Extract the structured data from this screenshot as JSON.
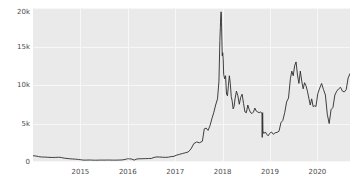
{
  "chart_data": {
    "type": "line",
    "title": "",
    "subtitle": "",
    "xlabel": "",
    "ylabel": "",
    "xlim": [
      2014.0,
      2020.7
    ],
    "ylim": [
      0,
      20000
    ],
    "grid": true,
    "legend": "none",
    "y_ticks": [
      {
        "value": 0,
        "label": "0"
      },
      {
        "value": 5000,
        "label": "5k"
      },
      {
        "value": 10000,
        "label": "10k"
      },
      {
        "value": 15000,
        "label": "15k"
      },
      {
        "value": 20000,
        "label": "20k"
      }
    ],
    "x_ticks": [
      {
        "value": 2015,
        "label": "2015"
      },
      {
        "value": 2016,
        "label": "2016"
      },
      {
        "value": 2017,
        "label": "2017"
      },
      {
        "value": 2018,
        "label": "2018"
      },
      {
        "value": 2019,
        "label": "2019"
      },
      {
        "value": 2020,
        "label": "2020"
      }
    ],
    "line_color": "#2b2b2b",
    "panel_color": "#eaeaea",
    "grid_color": "#f7f7f7",
    "series": [
      {
        "name": "price",
        "x": [
          2014.0,
          2014.06,
          2014.12,
          2014.18,
          2014.24,
          2014.3,
          2014.36,
          2014.42,
          2014.48,
          2014.54,
          2014.6,
          2014.66,
          2014.72,
          2014.78,
          2014.84,
          2014.9,
          2014.96,
          2015.02,
          2015.08,
          2015.14,
          2015.2,
          2015.26,
          2015.32,
          2015.38,
          2015.44,
          2015.5,
          2015.56,
          2015.62,
          2015.68,
          2015.74,
          2015.8,
          2015.86,
          2015.92,
          2015.98,
          2016.0,
          2016.02,
          2016.04,
          2016.08,
          2016.14,
          2016.2,
          2016.26,
          2016.32,
          2016.38,
          2016.44,
          2016.5,
          2016.56,
          2016.62,
          2016.68,
          2016.74,
          2016.8,
          2016.86,
          2016.92,
          2016.98,
          2017.04,
          2017.1,
          2017.16,
          2017.22,
          2017.28,
          2017.34,
          2017.4,
          2017.46,
          2017.52,
          2017.58,
          2017.62,
          2017.66,
          2017.7,
          2017.74,
          2017.78,
          2017.82,
          2017.86,
          2017.9,
          2017.93,
          2017.95,
          2017.96,
          2017.97,
          2017.975,
          2017.98,
          2017.985,
          2017.99,
          2018.0,
          2018.01,
          2018.02,
          2018.03,
          2018.05,
          2018.07,
          2018.09,
          2018.11,
          2018.13,
          2018.15,
          2018.17,
          2018.19,
          2018.21,
          2018.23,
          2018.25,
          2018.27,
          2018.3,
          2018.33,
          2018.36,
          2018.39,
          2018.42,
          2018.45,
          2018.48,
          2018.51,
          2018.54,
          2018.57,
          2018.6,
          2018.63,
          2018.66,
          2018.69,
          2018.72,
          2018.75,
          2018.78,
          2018.8,
          2018.82,
          2018.83,
          2018.84,
          2018.845,
          2018.85,
          2018.855,
          2018.86,
          2018.88,
          2018.91,
          2018.94,
          2018.97,
          2019.0,
          2019.04,
          2019.08,
          2019.12,
          2019.16,
          2019.2,
          2019.24,
          2019.28,
          2019.32,
          2019.36,
          2019.4,
          2019.44,
          2019.47,
          2019.5,
          2019.53,
          2019.56,
          2019.59,
          2019.62,
          2019.65,
          2019.68,
          2019.71,
          2019.74,
          2019.77,
          2019.8,
          2019.83,
          2019.86,
          2019.89,
          2019.92,
          2019.95,
          2019.98,
          2020.02,
          2020.06,
          2020.1,
          2020.14,
          2020.18,
          2020.22,
          2020.26,
          2020.3,
          2020.34,
          2020.38,
          2020.42,
          2020.46,
          2020.5,
          2020.54,
          2020.58,
          2020.62,
          2020.66,
          2020.7
        ],
        "y": [
          820,
          780,
          700,
          650,
          640,
          620,
          600,
          590,
          600,
          620,
          580,
          500,
          460,
          420,
          390,
          370,
          330,
          280,
          240,
          250,
          260,
          240,
          235,
          240,
          250,
          245,
          255,
          250,
          245,
          240,
          250,
          260,
          300,
          380,
          430,
          420,
          410,
          390,
          250,
          400,
          420,
          430,
          440,
          450,
          460,
          600,
          660,
          640,
          620,
          600,
          630,
          700,
          740,
          900,
          1000,
          1100,
          1200,
          1300,
          1700,
          2400,
          2600,
          2500,
          2700,
          4300,
          4400,
          4100,
          4700,
          5600,
          6400,
          7400,
          8200,
          10500,
          15800,
          17500,
          19200,
          19500,
          19300,
          18100,
          16500,
          13800,
          14200,
          13400,
          11400,
          10800,
          11200,
          8800,
          8600,
          9900,
          11200,
          10200,
          8500,
          7900,
          6900,
          7200,
          8200,
          9200,
          8600,
          7500,
          8400,
          8800,
          7600,
          6500,
          6400,
          7400,
          6800,
          6400,
          6300,
          6500,
          7000,
          6600,
          6500,
          6400,
          6500,
          6450,
          6400,
          6380,
          3200,
          6350,
          6400,
          4000,
          3700,
          3900,
          3600,
          3400,
          3700,
          3900,
          3600,
          3800,
          3850,
          4000,
          5100,
          5400,
          6400,
          7800,
          8300,
          10800,
          11800,
          11200,
          12500,
          13000,
          11300,
          10200,
          11800,
          10500,
          9500,
          10300,
          9900,
          9200,
          8300,
          7400,
          8200,
          7200,
          7300,
          7200,
          8900,
          9600,
          10200,
          9400,
          8700,
          6200,
          5000,
          6800,
          7100,
          8700,
          9200,
          9500,
          9700,
          9200,
          9100,
          9400,
          10900,
          11500
        ]
      }
    ]
  }
}
